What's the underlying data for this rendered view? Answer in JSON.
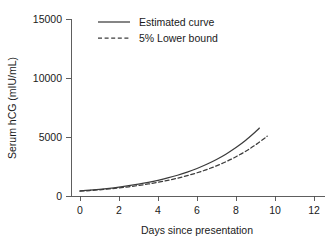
{
  "chart_data": {
    "type": "line",
    "title": "",
    "xlabel": "Days since presentation",
    "ylabel": "Serum hCG (mIU/mL)",
    "xlim": [
      -0.45,
      12.6
    ],
    "ylim": [
      -700,
      16200
    ],
    "xticks": [
      0,
      2,
      4,
      6,
      8,
      10,
      12
    ],
    "xtick_labels": [
      "0",
      "2",
      "4",
      "6",
      "8",
      "10",
      "12"
    ],
    "yticks": [
      0,
      5000,
      10000,
      15000
    ],
    "ytick_labels": [
      "0",
      "5000",
      "10000",
      "15000"
    ],
    "grid": false,
    "legend_position": "upper-left-inside",
    "line_color": "#3c3c3c",
    "axis_color": "#4d4d4d",
    "background_color": "#ffffff",
    "series": [
      {
        "name": "Estimated curve",
        "style": "solid",
        "x": [
          0,
          0.5,
          1,
          1.5,
          2,
          2.5,
          3,
          3.5,
          4,
          4.5,
          5,
          5.5,
          6,
          6.5,
          7,
          7.5,
          8,
          8.5,
          9,
          9.2
        ],
        "values": [
          430,
          495,
          570,
          655,
          755,
          870,
          1002,
          1153,
          1328,
          1529,
          1760,
          2027,
          2334,
          2687,
          3094,
          3563,
          4102,
          4724,
          5439,
          5758
        ]
      },
      {
        "name": "5% Lower bound",
        "style": "dashed",
        "x": [
          0,
          0.5,
          1,
          1.5,
          2,
          2.5,
          3,
          3.5,
          4,
          4.5,
          5,
          5.5,
          6,
          6.5,
          7,
          7.5,
          8,
          8.5,
          9,
          9.5,
          9.6
        ],
        "values": [
          405,
          462,
          527,
          601,
          686,
          782,
          892,
          1018,
          1161,
          1324,
          1511,
          1723,
          1966,
          2242,
          2557,
          2917,
          3327,
          3795,
          4329,
          4938,
          5072
        ]
      }
    ],
    "legend_entries": [
      {
        "label": "Estimated curve",
        "style": "solid"
      },
      {
        "label": "5% Lower bound",
        "style": "dashed"
      }
    ]
  }
}
